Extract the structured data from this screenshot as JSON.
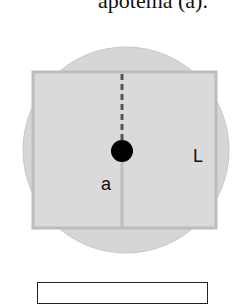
{
  "caption": "apotema (a).",
  "diagram": {
    "circle_fill": "#d6d6d6",
    "square_stroke": "#bdbdbd",
    "center_dot_color": "#000000",
    "dashed_line_color": "#555555",
    "labels": {
      "apothem": "a",
      "side": "L"
    }
  },
  "answer_box": ""
}
